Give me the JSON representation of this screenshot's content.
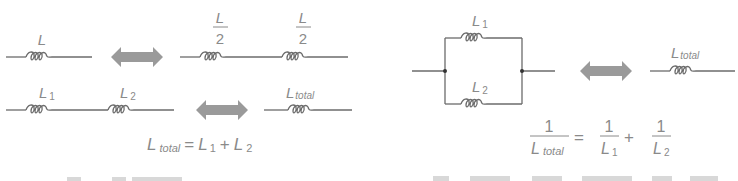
{
  "series_section": {
    "single": {
      "label": "L"
    },
    "split": {
      "left_num": "L",
      "left_den": "2",
      "right_num": "L",
      "right_den": "2"
    },
    "series_pair": {
      "l1": "L",
      "l1_sub": "1",
      "l2": "L",
      "l2_sub": "2",
      "total": "L",
      "total_sub": "total"
    },
    "formula": {
      "lhs": "L",
      "lhs_sub": "total",
      "eq": "=",
      "t1": "L",
      "t1_sub": "1",
      "plus": "+",
      "t2": "L",
      "t2_sub": "2"
    }
  },
  "parallel_section": {
    "top": {
      "label": "L",
      "sub": "1"
    },
    "bottom": {
      "label": "L",
      "sub": "2"
    },
    "equivalent": {
      "label": "L",
      "sub": "total"
    },
    "formula": {
      "lhs_num": "1",
      "lhs_den": "L",
      "lhs_den_sub": "total",
      "eq": "=",
      "t1_num": "1",
      "t1_den": "L",
      "t1_den_sub": "1",
      "plus": "+",
      "t2_num": "1",
      "t2_den": "L",
      "t2_den_sub": "2"
    }
  },
  "colors": {
    "wire": "#6b6b6b",
    "text": "#8a8a8a",
    "arrow": "#9a9a9a",
    "junction": "#333333"
  }
}
